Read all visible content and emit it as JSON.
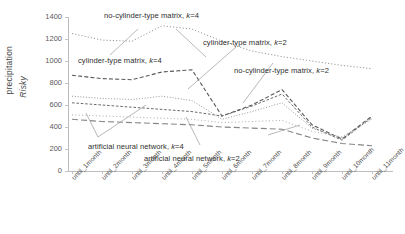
{
  "chart_data": {
    "type": "line",
    "title": "",
    "xlabel": "",
    "ylabel": "precipitation Risky",
    "ylabel_line1": "precipitation",
    "ylabel_line2": "Risky",
    "ylim": [
      0,
      1400
    ],
    "ytick_step": 200,
    "grid": false,
    "legend_position": "inline-annotations",
    "yticks": [
      "1400",
      "1200",
      "1000",
      "800",
      "600",
      "400",
      "200",
      "0"
    ],
    "categories": [
      "until_1month",
      "until_2month",
      "until_3month",
      "until_4month",
      "until_5month",
      "until_6month",
      "until_7month",
      "until_8month",
      "until_9month",
      "until_10month",
      "until_11month"
    ],
    "series": [
      {
        "name": "no-cylinder-type matrix, k=4",
        "style": "dotted",
        "values": [
          1250,
          1190,
          1180,
          1320,
          1290,
          1180,
          1090,
          1040,
          1000,
          960,
          930
        ]
      },
      {
        "name": "cylinder-type matrix, k=4",
        "style": "dashed",
        "values": [
          870,
          840,
          830,
          900,
          920,
          500,
          600,
          740,
          420,
          290,
          500
        ]
      },
      {
        "name": "no-cylinder-type matrix, k=2",
        "style": "dashed-fine",
        "values": [
          620,
          600,
          580,
          560,
          540,
          500,
          590,
          700,
          400,
          280,
          490
        ]
      },
      {
        "name": "cylinder-type matrix, k=2",
        "style": "dotted-fine",
        "values": [
          680,
          660,
          650,
          680,
          640,
          470,
          540,
          620,
          390,
          300,
          480
        ]
      },
      {
        "name": "artificial neural network, k=4",
        "style": "dotted-light",
        "values": [
          510,
          500,
          490,
          480,
          470,
          440,
          450,
          460,
          360,
          310,
          470
        ]
      },
      {
        "name": "artificial neural network, k=2",
        "style": "dashed-long",
        "values": [
          470,
          450,
          440,
          430,
          420,
          400,
          390,
          380,
          300,
          250,
          230
        ]
      }
    ],
    "annotations": [
      {
        "text": "no-cylinder-type matrix, ",
        "italic": "k",
        "tail": "=4"
      },
      {
        "text": "cylinder-type matrix, ",
        "italic": "k",
        "tail": "=2"
      },
      {
        "text": "cylinder-type matrix, ",
        "italic": "k",
        "tail": "=4"
      },
      {
        "text": "no-cylinder-type matrix, ",
        "italic": "k",
        "tail": "=2"
      },
      {
        "text": "artificial neural network, ",
        "italic": "k",
        "tail": "=4"
      },
      {
        "text": "artificial neural network, ",
        "italic": "k",
        "tail": "=2"
      }
    ]
  },
  "axis": {
    "y_title_line1": "precipitation",
    "y_title_line2": "Risky",
    "y_ticks": [
      "1400",
      "1200",
      "1000",
      "800",
      "600",
      "400",
      "200",
      "0"
    ],
    "x_ticks": [
      "until_1month",
      "until_2month",
      "until_3month",
      "until_4month",
      "until_5month",
      "until_6month",
      "until_7month",
      "until_8month",
      "until_9month",
      "until_10month",
      "until_11month"
    ]
  },
  "annotations": {
    "a1_main": "no-cylinder-type matrix, ",
    "a1_k": "k",
    "a1_tail": "=4",
    "a2_main": "cylinder-type matrix, ",
    "a2_k": "k",
    "a2_tail": "=2",
    "a3_main": "cylinder-type matrix, ",
    "a3_k": "k",
    "a3_tail": "=4",
    "a4_main": "no-cylinder-type matrix, ",
    "a4_k": "k",
    "a4_tail": "=2",
    "a5_main": "artificial neural network, ",
    "a5_k": "k",
    "a5_tail": "=4",
    "a6_main": "artificial neural network, ",
    "a6_k": "k",
    "a6_tail": "=2"
  },
  "colors": {
    "line": "#6f6f6f",
    "axis": "#bdbdbd",
    "text": "#3a3a3a",
    "background": "#ffffff"
  }
}
